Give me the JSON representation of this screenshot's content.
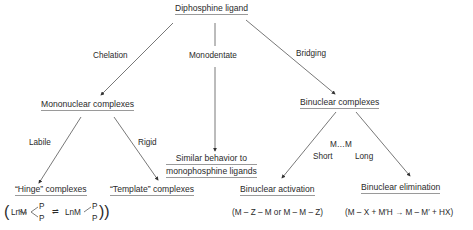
{
  "root": {
    "label": "Diphosphine ligand"
  },
  "edges": {
    "chelation": "Chelation",
    "monodentate": "Monodentate",
    "bridging": "Bridging",
    "labile": "Labile",
    "rigid": "Rigid",
    "mm": "M…M",
    "short": "Short",
    "long": "Long"
  },
  "nodes": {
    "mononuclear": "Mononuclear complexes",
    "similar_line1": "Similar behavior to",
    "similar_line2": "monophosphine ligands",
    "binuclear": "Binuclear complexes",
    "hinge": "“Hinge” complexes",
    "template": "“Template” complexes",
    "activation": "Binuclear activation",
    "elimination": "Binuclear elimination"
  },
  "formulas": {
    "hinge": "(LnM<P/P ⇌ LnM–P, P))",
    "activation": "(M – Z – M or M – M – Z)",
    "elimination": "(M – X + M′H → M – M′ + HX)"
  },
  "hinge_formula_parts": {
    "open": "(",
    "left_complex": "LnM",
    "p_top": "P",
    "p_bottom": "P",
    "arrow": "⇌",
    "right_complex": "LnM",
    "p_right_top": "P",
    "p_right_bottom": "P",
    "close": "))"
  }
}
